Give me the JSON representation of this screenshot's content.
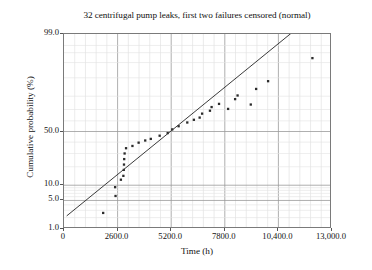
{
  "chart_data": {
    "type": "scatter",
    "title": "32 centrifugal pump leaks, first two failures censored (normal)",
    "xlabel": "Time (h)",
    "ylabel": "Cumulative probability (%)",
    "xlim": [
      0,
      13000
    ],
    "ylim_percent": [
      1.0,
      99.0
    ],
    "y_scale": "normal-probability",
    "x_scale": "linear",
    "grid": "major and minor gridlines, light gray",
    "legend": "none",
    "xticks": [
      0,
      2600,
      5200,
      7800,
      10400,
      13000
    ],
    "xtick_labels": [
      "0",
      "2600.0",
      "5200.0",
      "7800.0",
      "10,400.0",
      "13,000.0"
    ],
    "x_minor_per_major": 4,
    "yticks": [
      1.0,
      5.0,
      10.0,
      50.0,
      99.0
    ],
    "ytick_labels": [
      "1.0",
      "5.0",
      "10.0",
      "50.0",
      "99.0"
    ],
    "series": [
      {
        "name": "leak times",
        "type": "scatter",
        "marker": "square",
        "marker_size": 2.3,
        "color": "#2b2b2b",
        "points": [
          [
            1900,
            2.6
          ],
          [
            2500,
            6.2
          ],
          [
            2480,
            9.2
          ],
          [
            2760,
            12.5
          ],
          [
            2880,
            14.5
          ],
          [
            2900,
            18.0
          ],
          [
            2910,
            21.5
          ],
          [
            2920,
            25.5
          ],
          [
            2940,
            30.0
          ],
          [
            3010,
            34.5
          ],
          [
            3320,
            36.5
          ],
          [
            3620,
            39.5
          ],
          [
            3940,
            41.5
          ],
          [
            4210,
            43.0
          ],
          [
            4640,
            46.0
          ],
          [
            5030,
            48.5
          ],
          [
            5250,
            52.0
          ],
          [
            5560,
            55.0
          ],
          [
            5980,
            58.5
          ],
          [
            6300,
            61.0
          ],
          [
            6580,
            63.0
          ],
          [
            6700,
            66.5
          ],
          [
            7080,
            69.0
          ],
          [
            7160,
            72.0
          ],
          [
            7520,
            74.5
          ],
          [
            7960,
            70.5
          ],
          [
            8300,
            78.0
          ],
          [
            8420,
            80.5
          ],
          [
            9060,
            74.0
          ],
          [
            9320,
            84.5
          ],
          [
            9900,
            88.5
          ],
          [
            12050,
            96.0
          ]
        ]
      },
      {
        "name": "fitted normal line",
        "type": "line",
        "color": "#3a3a3a",
        "width": 1,
        "endpoints": [
          [
            130,
            2.2
          ],
          [
            11300,
            99.3
          ]
        ]
      }
    ]
  }
}
